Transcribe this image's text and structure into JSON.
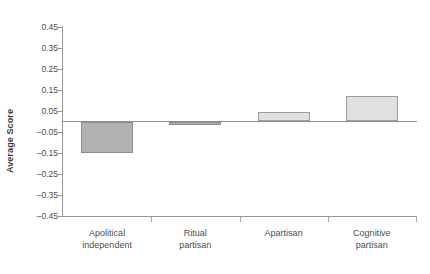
{
  "chart_data": {
    "type": "bar",
    "title": "",
    "xlabel": "",
    "ylabel": "Average Score",
    "categories": [
      "Apolitical independent",
      "Ritual partisan",
      "Apartisan",
      "Cognitive partisan"
    ],
    "category_lines": [
      [
        "Apolitical",
        "independent"
      ],
      [
        "Ritual",
        "partisan"
      ],
      [
        "Apartisan",
        ""
      ],
      [
        "Cognitive",
        "partisan"
      ]
    ],
    "values": [
      -0.15,
      -0.015,
      0.045,
      0.12
    ],
    "ylim": [
      -0.45,
      0.45
    ],
    "yticks": [
      "0.45",
      "0.35",
      "0.25",
      "0.15",
      "0.05",
      "–0.05",
      "–0.15",
      "–0.25",
      "–0.35",
      "–0.45"
    ],
    "ytick_values": [
      0.45,
      0.35,
      0.25,
      0.15,
      0.05,
      -0.05,
      -0.15,
      -0.25,
      -0.35,
      -0.45
    ],
    "grid": false,
    "legend": "none",
    "colors": {
      "negative_bar_fill": "#b2b2b2",
      "negative_bar_stroke": "#8e8e8e",
      "positive_bar_fill": "#e0e0e0",
      "positive_bar_stroke": "#9d9d9d",
      "axis": "#9a9a9a",
      "zero_line": "#8f8f8f",
      "text": "#4d4d4d",
      "background": "#ffffff"
    }
  },
  "figure": {
    "cropped_header_text": ""
  }
}
